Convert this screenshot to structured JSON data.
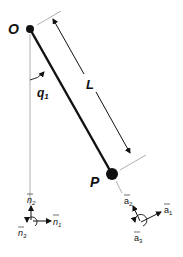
{
  "diagram": {
    "labels": {
      "pivot": "O",
      "bob": "P",
      "length": "L",
      "angle": "q",
      "angle_sub": "1"
    },
    "frame_n": {
      "x_axis": "n",
      "x_sub": "1",
      "y_axis": "n",
      "y_sub": "2",
      "z_axis": "n",
      "z_sub": "3"
    },
    "frame_a": {
      "x_axis": "a",
      "x_sub": "1",
      "y_axis": "a",
      "y_sub": "2",
      "z_axis": "a",
      "z_sub": "3"
    },
    "colors": {
      "ink": "#111111",
      "guide": "#999999"
    }
  }
}
